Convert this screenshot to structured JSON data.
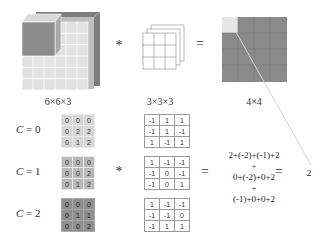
{
  "top": {
    "input_label": "6×6×3",
    "filter_label": "3×3×3",
    "output_label": "4×4",
    "conv_operator": "*",
    "equals_operator": "="
  },
  "channels": [
    {
      "label": "C",
      "eq": "= 0",
      "image": [
        [
          0,
          0,
          0
        ],
        [
          0,
          2,
          2
        ],
        [
          0,
          1,
          2
        ]
      ],
      "filter": [
        [
          -1,
          1,
          1
        ],
        [
          -1,
          1,
          -1
        ],
        [
          1,
          -1,
          1
        ]
      ]
    },
    {
      "label": "C",
      "eq": "= 1",
      "image": [
        [
          0,
          0,
          0
        ],
        [
          0,
          0,
          2
        ],
        [
          0,
          1,
          2
        ]
      ],
      "filter": [
        [
          1,
          -1,
          -1
        ],
        [
          -1,
          0,
          -1
        ],
        [
          -1,
          0,
          1
        ]
      ]
    },
    {
      "label": "C",
      "eq": "= 2",
      "image": [
        [
          0,
          0,
          0
        ],
        [
          0,
          1,
          1
        ],
        [
          0,
          0,
          2
        ]
      ],
      "filter": [
        [
          1,
          -1,
          -1
        ],
        [
          -1,
          -1,
          0
        ],
        [
          -1,
          1,
          1
        ]
      ]
    }
  ],
  "bottom": {
    "conv_operator": "*",
    "equals_operator": "=",
    "sum_lines": [
      "2+(-2)+(-1)+2",
      "+",
      "0+(-2)+0+2",
      "+",
      "(-1)+0+0+2"
    ],
    "equals2": "=",
    "result": "2"
  },
  "colors": {
    "channel0": "#d6d6d6",
    "channel1": "#b9b9b9",
    "channel2": "#8f8f8f",
    "output_grid": "#8a8a8a",
    "output_highlight": "#e6e6e6"
  }
}
